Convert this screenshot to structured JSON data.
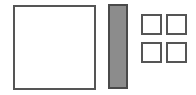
{
  "diagram": {
    "shapes": [
      {
        "id": "big-square",
        "kind": "square",
        "fill": "#ffffff",
        "stroke": "#555555"
      },
      {
        "id": "tall-bar",
        "kind": "rectangle",
        "fill": "#8c8c8c",
        "stroke": "#4a4a4a"
      },
      {
        "id": "tile-1",
        "kind": "square",
        "fill": "#ffffff",
        "stroke": "#555555"
      },
      {
        "id": "tile-2",
        "kind": "square",
        "fill": "#ffffff",
        "stroke": "#555555"
      },
      {
        "id": "tile-3",
        "kind": "square",
        "fill": "#ffffff",
        "stroke": "#555555"
      },
      {
        "id": "tile-4",
        "kind": "square",
        "fill": "#ffffff",
        "stroke": "#555555"
      }
    ],
    "grid": {
      "rows": 2,
      "cols": 2
    }
  }
}
